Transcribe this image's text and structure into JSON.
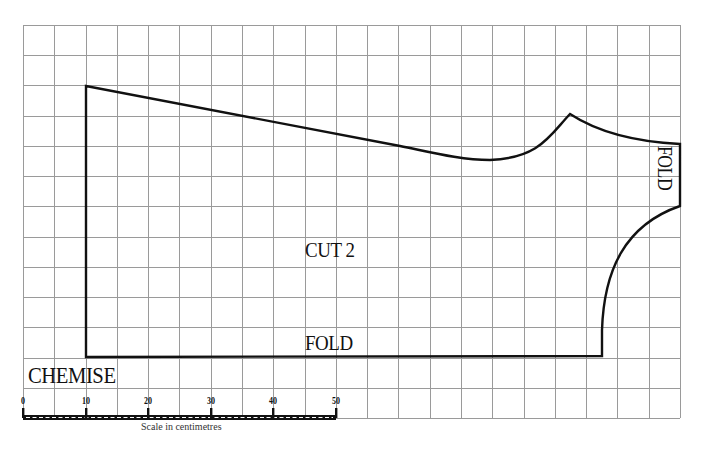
{
  "pattern": {
    "title": "CHEMISE",
    "instruction": "CUT 2",
    "fold_bottom": "FOLD",
    "fold_side": "FOLD"
  },
  "grid": {
    "left": 23,
    "top": 25,
    "right": 680,
    "bottom": 418,
    "columns": 21,
    "rows": 13,
    "line_color": "#9a9a9a"
  },
  "outline": {
    "stroke": "#111111",
    "path": "M86,86 L86,357 L602,356 L602,330 C604,270 625,225 680,206 L680,144 C660,143 610,140 570,114 C550,135 540,158 490,160 C460,160 430,152 400,146 L86,86 Z"
  },
  "scale_bar": {
    "caption": "Scale in centimetres",
    "unit": "cm",
    "ticks": [
      {
        "label": "0",
        "x": 23
      },
      {
        "label": "10",
        "x": 86
      },
      {
        "label": "20",
        "x": 148
      },
      {
        "label": "30",
        "x": 211
      },
      {
        "label": "40",
        "x": 273
      },
      {
        "label": "50",
        "x": 336
      }
    ],
    "x_start": 23,
    "x_end": 336,
    "y": 418
  }
}
